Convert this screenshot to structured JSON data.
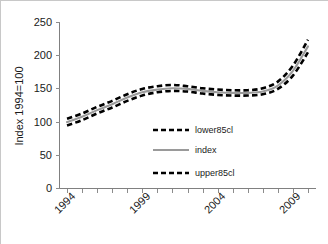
{
  "chart_data": {
    "type": "line",
    "title": "",
    "subtitle": "",
    "xlabel": "",
    "ylabel": "Index 1994=100",
    "xlim": [
      1993.5,
      2010.5
    ],
    "ylim": [
      0,
      250
    ],
    "grid": false,
    "legend_position": "center-right inside plot area",
    "y_ticks": [
      0,
      50,
      100,
      150,
      200,
      250
    ],
    "y_tick_labels": [
      "0",
      "50",
      "100",
      "150",
      "200",
      "250"
    ],
    "x_tick_labels_shown": [
      "1994",
      "1999",
      "2004",
      "2009"
    ],
    "x_tick_label_rotation_deg": 45,
    "x": [
      1994,
      1995,
      1996,
      1997,
      1998,
      1999,
      2000,
      2001,
      2002,
      2003,
      2004,
      2005,
      2006,
      2007,
      2008,
      2009,
      2010
    ],
    "series": [
      {
        "name": "lower85cl",
        "style": "dashed",
        "color": "#000000",
        "values": [
          95,
          103,
          113,
          122,
          132,
          140,
          145,
          147,
          146,
          143,
          141,
          140,
          140,
          142,
          150,
          170,
          205
        ]
      },
      {
        "name": "index",
        "style": "solid",
        "color": "#9a9a9a",
        "values": [
          100,
          108,
          118,
          127,
          137,
          145,
          149,
          151,
          150,
          147,
          145,
          144,
          144,
          146,
          155,
          177,
          214
        ]
      },
      {
        "name": "upper85cl",
        "style": "dashed",
        "color": "#000000",
        "values": [
          105,
          113,
          123,
          132,
          142,
          150,
          154,
          156,
          154,
          151,
          149,
          148,
          148,
          151,
          161,
          185,
          224
        ]
      }
    ]
  },
  "axes": {
    "y_axis_label": "Index 1994=100",
    "y_tick_labels": [
      "250",
      "200",
      "150",
      "100",
      "50",
      "0"
    ],
    "x_tick_labels": [
      "1994",
      "1999",
      "2004",
      "2009"
    ]
  },
  "legend": {
    "items": [
      {
        "label": "lower85cl",
        "style": "dashed",
        "color": "#000000"
      },
      {
        "label": "index",
        "style": "solid",
        "color": "#9a9a9a"
      },
      {
        "label": "upper85cl",
        "style": "dashed",
        "color": "#000000"
      }
    ]
  },
  "colors": {
    "background": "#ffffff",
    "frame": "#c8c8c8",
    "axis": "#808080",
    "ci_line": "#000000",
    "index_line": "#9a9a9a",
    "text": "#1a1a1a"
  }
}
